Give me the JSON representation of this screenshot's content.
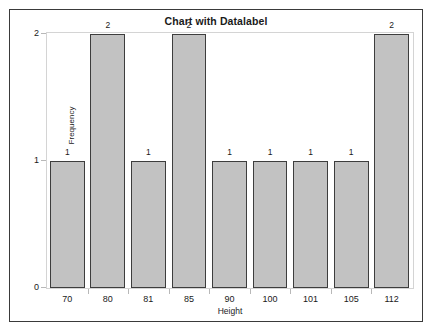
{
  "chart_data": {
    "type": "bar",
    "title": "Chart with Datalabel",
    "xlabel": "Height",
    "ylabel": "Frequency",
    "categories": [
      "70",
      "80",
      "81",
      "85",
      "90",
      "100",
      "101",
      "105",
      "112"
    ],
    "values": [
      1,
      2,
      1,
      2,
      1,
      1,
      1,
      1,
      2
    ],
    "datalabels": [
      "1",
      "2",
      "1",
      "2",
      "1",
      "1",
      "1",
      "1",
      "2"
    ],
    "yticks": [
      "0",
      "1",
      "2"
    ],
    "ylim": [
      0,
      2
    ],
    "grid": false,
    "legend": null,
    "bar_fill_color": "#c2c2c2",
    "bar_border_color": "#3d3d3d",
    "figure_border_color": "#3a3a3a",
    "plot_frame_color": "#d4d4d4",
    "text_color": "#1a1a1a"
  }
}
